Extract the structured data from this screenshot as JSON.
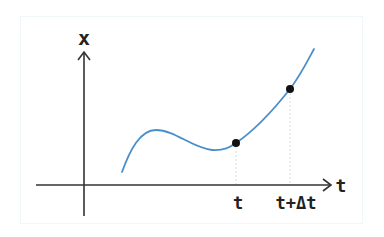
{
  "diagram": {
    "y_axis_label": "x",
    "x_axis_label": "t",
    "tick_labels": {
      "t": "t",
      "t_plus_dt": "t+Δt"
    },
    "points": [
      {
        "name": "point-at-t",
        "x": 236,
        "y": 143
      },
      {
        "name": "point-at-t-plus-dt",
        "x": 290,
        "y": 89
      }
    ],
    "colors": {
      "curve": "#4a8fcc",
      "axis": "#333333",
      "point": "#111111",
      "guide": "#d8dde4",
      "frame": "#eef8f8"
    }
  }
}
